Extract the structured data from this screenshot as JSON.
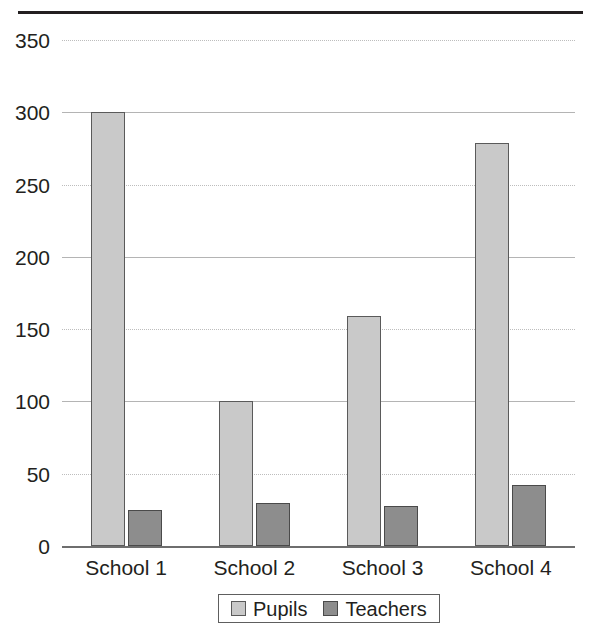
{
  "chart_data": {
    "type": "bar",
    "title": "",
    "subtitle": "",
    "xlabel": "",
    "ylabel": "",
    "categories": [
      "School 1",
      "School 2",
      "School 3",
      "School 4"
    ],
    "series": [
      {
        "name": "Pupils",
        "color": "#c9c9c9",
        "values": [
          300,
          100,
          159,
          279
        ]
      },
      {
        "name": "Teachers",
        "color": "#8d8d8d",
        "values": [
          25,
          30,
          28,
          42
        ]
      }
    ],
    "ylim": [
      0,
      350
    ],
    "ytick_values": [
      0,
      50,
      100,
      150,
      200,
      250,
      300,
      350
    ],
    "ytick_labels": [
      "0",
      "50",
      "100",
      "150",
      "200",
      "250",
      "300",
      "350"
    ],
    "grid": true,
    "grid_axis": "y",
    "legend_position": "bottom-center",
    "annotations": []
  },
  "figure": {
    "top_rule_color": "#231f20",
    "background": "#ffffff",
    "axis_color": "#6e6e6e",
    "gridline_color": "#b9b9b9",
    "text_color": "#231f20"
  }
}
